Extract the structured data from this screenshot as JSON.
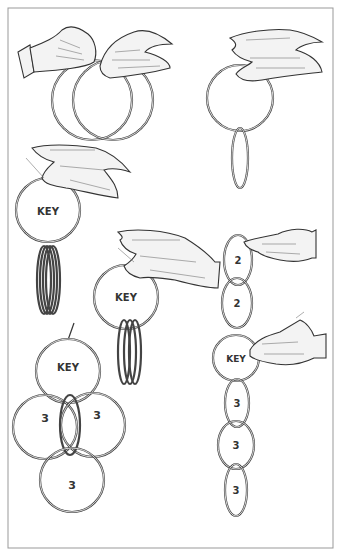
{
  "illustration": {
    "subject": "Linking rings magic trick",
    "labels": {
      "key": "KEY",
      "two": "2",
      "three": "3"
    },
    "figures": [
      {
        "id": "fig-two-rings-linked",
        "rings": 2,
        "labels": []
      },
      {
        "id": "fig-ring-with-hanging-ring",
        "rings": 2,
        "labels": []
      },
      {
        "id": "fig-key-ring-with-stack",
        "rings": 5,
        "labels": [
          "KEY"
        ]
      },
      {
        "id": "fig-key-ring-held-stack",
        "rings": 3,
        "labels": [
          "KEY"
        ]
      },
      {
        "id": "fig-flower-formation",
        "rings": 4,
        "labels": [
          "KEY",
          "3",
          "3",
          "3"
        ]
      },
      {
        "id": "fig-chain",
        "rings": 6,
        "labels": [
          "2",
          "2",
          "KEY",
          "3",
          "3",
          "3"
        ]
      }
    ]
  }
}
